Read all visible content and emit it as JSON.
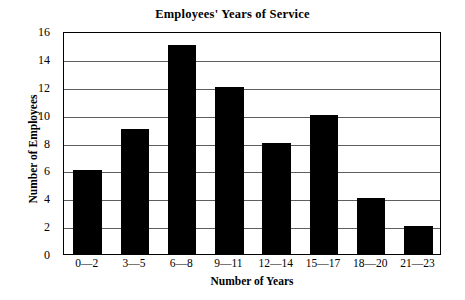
{
  "chart_data": {
    "type": "bar",
    "title": "Employees' Years of Service",
    "xlabel": "Number of Years",
    "ylabel": "Number of Employees",
    "categories": [
      "0—2",
      "3—5",
      "6—8",
      "9—11",
      "12—14",
      "15—17",
      "18—20",
      "21—23"
    ],
    "values": [
      6,
      9,
      15,
      12,
      8,
      10,
      4,
      2
    ],
    "ylim": [
      0,
      16
    ],
    "ytick_step": 2,
    "ytick_labels": [
      "0",
      "2",
      "4",
      "6",
      "8",
      "10",
      "12",
      "14",
      "16"
    ],
    "grid": true,
    "grid_orientation": "horizontal",
    "legend": false,
    "bar_color": "#000000",
    "grid_color": "#5e5e5e",
    "axis_color": "#000000",
    "background_color": "#ffffff"
  }
}
